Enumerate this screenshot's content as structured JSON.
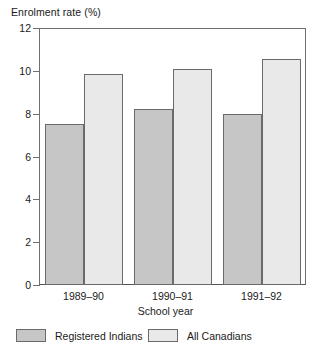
{
  "chart_data": {
    "type": "bar",
    "title": "",
    "ylabel": "Enrolment rate (%)",
    "xlabel": "School year",
    "categories": [
      "1989–90",
      "1990–91",
      "1991–92"
    ],
    "series": [
      {
        "name": "Registered Indians",
        "values": [
          7.5,
          8.2,
          8.0
        ],
        "color": "#c6c6c6"
      },
      {
        "name": "All Canadians",
        "values": [
          9.85,
          10.1,
          10.55
        ],
        "color": "#e9e9e9"
      }
    ],
    "ylim": [
      0,
      12
    ],
    "yticks": [
      0,
      2,
      4,
      6,
      8,
      10,
      12
    ],
    "ytick_labels": [
      "0",
      "2",
      "4",
      "6",
      "8",
      "10",
      "12"
    ],
    "grid": false,
    "legend_position": "bottom"
  },
  "axes": {
    "y_title": "Enrolment rate (%)",
    "x_title": "School year",
    "y_tick_labels": [
      "12",
      "10",
      "8",
      "6",
      "4",
      "2",
      "0"
    ],
    "x_tick_labels": [
      "1989–90",
      "1990–91",
      "1991–92"
    ]
  },
  "legend": {
    "items": [
      {
        "label": "Registered Indians",
        "swatch_color": "#c6c6c6"
      },
      {
        "label": "All Canadians",
        "swatch_color": "#e9e9e9"
      }
    ]
  },
  "style": {
    "frame_color": "#6f6f6f",
    "bar_border_color": "#6a6a6a",
    "background": "#ffffff",
    "text_color": "#1a1a1a"
  }
}
